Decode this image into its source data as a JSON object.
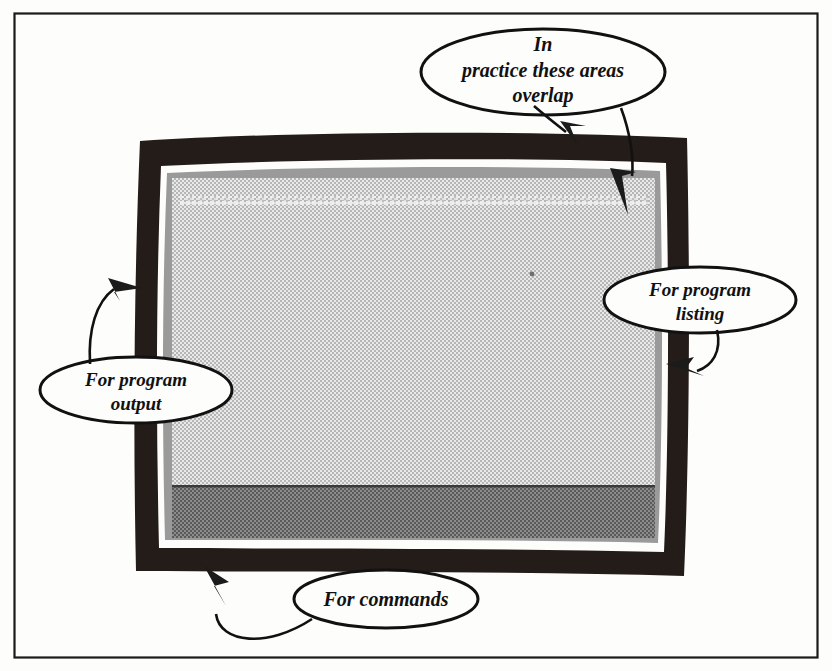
{
  "figure": {
    "border_color": "#1a1a1a",
    "bezel_color": "#241c18",
    "screen_color": "#d6d6d6",
    "command_band_color": "#7d7d7d",
    "ink_color": "#111111",
    "paper_color": "#fdfdfb"
  },
  "monitor": {
    "bezel_name": "monitor-bezel",
    "screen_name": "monitor-screen",
    "regions": [
      {
        "id": "listing-area",
        "label": "program listing area"
      },
      {
        "id": "output-area",
        "label": "program output area"
      },
      {
        "id": "command-area",
        "label": "command area"
      }
    ]
  },
  "callouts": [
    {
      "id": "overlap",
      "lines": [
        "In",
        "practice these areas",
        "overlap"
      ],
      "arrows": 2
    },
    {
      "id": "program-listing",
      "lines": [
        "For program",
        "listing"
      ],
      "arrows": 1
    },
    {
      "id": "program-output",
      "lines": [
        "For program",
        "output"
      ],
      "arrows": 1
    },
    {
      "id": "commands",
      "lines": [
        "For commands"
      ],
      "arrows": 1
    }
  ]
}
